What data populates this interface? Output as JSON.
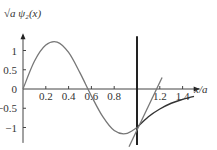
{
  "chart_data": {
    "type": "line",
    "title": "",
    "ylabel": "√a ψ₂(x)",
    "xlabel": "x/a",
    "xlim": [
      0,
      1.55
    ],
    "ylim": [
      -1.4,
      1.45
    ],
    "x_ticks": [
      0.2,
      0.4,
      0.6,
      0.8,
      1.2,
      1.4
    ],
    "x_tick_labels": [
      "0.2",
      "0.4",
      "0.6",
      "0.8",
      "1.2",
      "1.4"
    ],
    "y_ticks": [
      1,
      0.5,
      0,
      -0.5,
      -1
    ],
    "y_tick_labels": [
      "1",
      "0.5",
      "0",
      "−0.5",
      "−1"
    ],
    "boundary_x": 1.0,
    "series": [
      {
        "name": "wavefunction",
        "color": "#777777",
        "description": "inside well: sine; outside: exponential decay",
        "x": [
          0,
          0.1,
          0.2,
          0.3,
          0.4,
          0.5,
          0.6,
          0.7,
          0.8,
          0.9,
          1.0
        ],
        "y": [
          0,
          0.72,
          1.14,
          1.22,
          0.95,
          0.42,
          -0.18,
          -0.72,
          -1.08,
          -1.16,
          -1.0
        ]
      },
      {
        "name": "exterior-decay",
        "color": "#333333",
        "x": [
          1.0,
          1.1,
          1.2,
          1.3,
          1.4,
          1.5
        ],
        "y": [
          -1.0,
          -0.72,
          -0.52,
          -0.37,
          -0.27,
          -0.19
        ]
      },
      {
        "name": "tangent-line",
        "color": "#777777",
        "x": [
          0.93,
          1.22
        ],
        "y": [
          -1.5,
          0.3
        ]
      }
    ],
    "grid": false,
    "legend": "none"
  }
}
